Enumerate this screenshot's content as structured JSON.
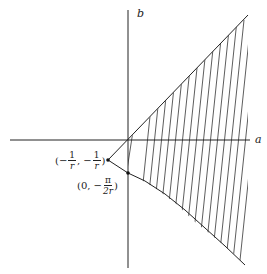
{
  "axes": {
    "x_label": "a",
    "y_label": "b"
  },
  "points": [
    {
      "name": "vertex",
      "label_parts": {
        "open": "(−",
        "num1": "1",
        "den1": "r",
        "mid": ", −",
        "num2": "1",
        "den2": "r",
        "close": ")"
      }
    },
    {
      "name": "b-intercept",
      "label_parts": {
        "open": "(0, −",
        "num": "π",
        "den": "2r",
        "close": ")"
      }
    }
  ],
  "colors": {
    "line": "#222222",
    "background": "#ffffff"
  }
}
